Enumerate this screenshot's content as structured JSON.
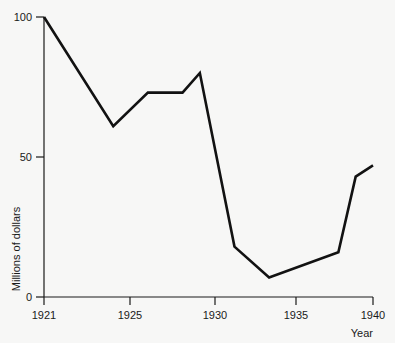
{
  "chart_data": {
    "type": "line",
    "title": "",
    "subtitle": "",
    "xlabel": "Year",
    "ylabel": "Millions of dollars",
    "xlim": [
      1921,
      1940
    ],
    "ylim": [
      0,
      100
    ],
    "grid": false,
    "legend": null,
    "legend_position": "none",
    "line_color": "#121212",
    "background_color": "#f7f7f6",
    "axis_color": "#1a1a1a",
    "x_ticks": [
      1921,
      1925,
      1930,
      1935,
      1940
    ],
    "x_tick_labels": [
      "1921",
      "1925",
      "1930",
      "1935",
      "1940"
    ],
    "y_ticks": [
      0,
      50,
      100
    ],
    "y_tick_labels": [
      "0",
      "50",
      "100"
    ],
    "x": [
      1921,
      1925,
      1927,
      1929,
      1930,
      1932,
      1934,
      1938,
      1939,
      1940
    ],
    "values": [
      100,
      61,
      73,
      73,
      80,
      18,
      7,
      16,
      43,
      47
    ],
    "series": [
      {
        "name": "Millions of dollars",
        "x": [
          1921,
          1925,
          1927,
          1929,
          1930,
          1932,
          1934,
          1938,
          1939,
          1940
        ],
        "values": [
          100,
          61,
          73,
          73,
          80,
          18,
          7,
          16,
          43,
          47
        ]
      }
    ],
    "annotations": []
  },
  "axes": {
    "y_label": "Millions of dollars",
    "x_label": "Year",
    "y_tick_labels": [
      "100",
      "50",
      "0"
    ],
    "x_tick_labels": [
      "1921",
      "1925",
      "1930",
      "1935",
      "1940"
    ]
  }
}
